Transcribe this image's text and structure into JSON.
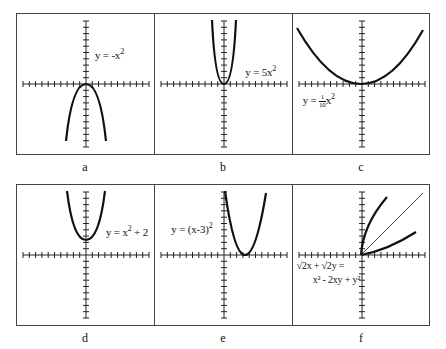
{
  "figure": {
    "panels": [
      {
        "id": "a",
        "caption": "a",
        "equation": "y = -x²",
        "eq_main": "y = -x",
        "eq_sup": "2"
      },
      {
        "id": "b",
        "caption": "b",
        "equation": "y = 5x²",
        "eq_main": "y = 5x",
        "eq_sup": "2"
      },
      {
        "id": "c",
        "caption": "c",
        "equation": "y = (1/10)x²",
        "eq_pre": "y = ",
        "eq_num": "1",
        "eq_den": "10",
        "eq_post": "x",
        "eq_sup": "2"
      },
      {
        "id": "d",
        "caption": "d",
        "equation": "y = x² + 2",
        "eq_pre": "y = x",
        "eq_sup": "2",
        "eq_post": " + 2"
      },
      {
        "id": "e",
        "caption": "e",
        "equation": "y = (x-3)²",
        "eq_main": "y = (x-3)",
        "eq_sup": "2"
      },
      {
        "id": "f",
        "caption": "f",
        "equation": "√2x + √2y = x² - 2xy + y²",
        "eq_line1": "√2x + √2y =",
        "eq_line2": "x² - 2xy + y²"
      }
    ]
  },
  "chart_data": [
    {
      "type": "line",
      "title": "a",
      "equation": "y = -x^2",
      "x": [
        -3,
        -2,
        -1,
        0,
        1,
        2,
        3
      ],
      "y": [
        -9,
        -4,
        -1,
        0,
        -1,
        -4,
        -9
      ],
      "xlim": [
        -10,
        10
      ],
      "ylim": [
        -10,
        10
      ],
      "grid": false,
      "axis_ticks": "unit ticks, 10 per half-axis"
    },
    {
      "type": "line",
      "title": "b",
      "equation": "y = 5x^2",
      "x": [
        -1.4,
        -1,
        -0.5,
        0,
        0.5,
        1,
        1.4
      ],
      "y": [
        9.8,
        5,
        1.25,
        0,
        1.25,
        5,
        9.8
      ],
      "xlim": [
        -10,
        10
      ],
      "ylim": [
        -10,
        10
      ],
      "grid": false
    },
    {
      "type": "line",
      "title": "c",
      "equation": "y = (1/10)x^2",
      "x": [
        -10,
        -5,
        0,
        5,
        10
      ],
      "y": [
        10,
        2.5,
        0,
        2.5,
        10
      ],
      "xlim": [
        -10,
        10
      ],
      "ylim": [
        -10,
        10
      ],
      "grid": false
    },
    {
      "type": "line",
      "title": "d",
      "equation": "y = x^2 + 2",
      "x": [
        -3,
        -2,
        -1,
        0,
        1,
        2,
        3
      ],
      "y": [
        11,
        6,
        3,
        2,
        3,
        6,
        11
      ],
      "xlim": [
        -10,
        10
      ],
      "ylim": [
        -10,
        10
      ],
      "grid": false
    },
    {
      "type": "line",
      "title": "e",
      "equation": "y = (x-3)^2",
      "x": [
        0,
        1,
        2,
        3,
        4,
        5,
        6
      ],
      "y": [
        9,
        4,
        1,
        0,
        1,
        4,
        9
      ],
      "xlim": [
        -10,
        10
      ],
      "ylim": [
        -10,
        10
      ],
      "grid": false
    },
    {
      "type": "line",
      "title": "f",
      "equation": "sqrt(2)x + sqrt(2)y = x^2 - 2xy + y^2",
      "series": [
        {
          "name": "upper branch",
          "x": [
            0,
            0.5,
            2,
            4
          ],
          "y": [
            0,
            2,
            6,
            9
          ]
        },
        {
          "name": "lower branch",
          "x": [
            0,
            2,
            6,
            9
          ],
          "y": [
            0,
            0.5,
            2,
            4
          ]
        },
        {
          "name": "reference line y=x",
          "x": [
            0,
            10
          ],
          "y": [
            0,
            10
          ]
        }
      ],
      "xlim": [
        -10,
        10
      ],
      "ylim": [
        -10,
        10
      ],
      "grid": false
    }
  ]
}
